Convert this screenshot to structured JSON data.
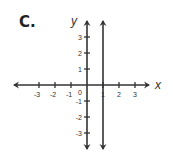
{
  "problem": {
    "label": "C."
  },
  "chart_data": {
    "type": "line",
    "title": "",
    "xlabel": "x",
    "ylabel": "y",
    "xlim": [
      -4,
      4
    ],
    "ylim": [
      -4,
      4
    ],
    "grid": false,
    "x_ticks": [
      -3,
      -2,
      -1,
      1,
      2,
      3
    ],
    "y_ticks": [
      -3,
      -2,
      -1,
      1,
      2,
      3
    ],
    "origin_label": "0",
    "series": [
      {
        "name": "vertical line x = 1",
        "equation": "x = 1",
        "points": [
          [
            1,
            -4
          ],
          [
            1,
            4
          ]
        ]
      }
    ],
    "colors": {
      "axis": "#333333",
      "line": "#333333"
    }
  }
}
